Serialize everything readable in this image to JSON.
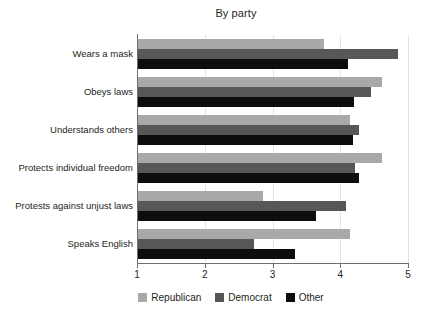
{
  "chart_data": {
    "type": "bar",
    "orientation": "horizontal",
    "title": "By party",
    "xlabel": "",
    "ylabel": "",
    "xlim": [
      1,
      5
    ],
    "xticks": [
      1,
      2,
      3,
      4,
      5
    ],
    "xtick_labels": [
      "1",
      "2",
      "3",
      "4",
      "5"
    ],
    "grid": true,
    "legend_position": "bottom-center",
    "categories": [
      "Wears a mask",
      "Obeys laws",
      "Understands others",
      "Protects individual freedom",
      "Protests against unjust laws",
      "Speaks English"
    ],
    "series": [
      {
        "name": "Republican",
        "color": "#a9a9a9",
        "values": [
          3.76,
          4.62,
          4.14,
          4.61,
          2.86,
          4.14
        ]
      },
      {
        "name": "Democrat",
        "color": "#575757",
        "values": [
          4.85,
          4.45,
          4.28,
          4.22,
          4.08,
          2.73
        ]
      },
      {
        "name": "Other",
        "color": "#0d0d0d",
        "values": [
          4.11,
          4.2,
          4.19,
          4.28,
          3.64,
          3.33
        ]
      }
    ]
  }
}
